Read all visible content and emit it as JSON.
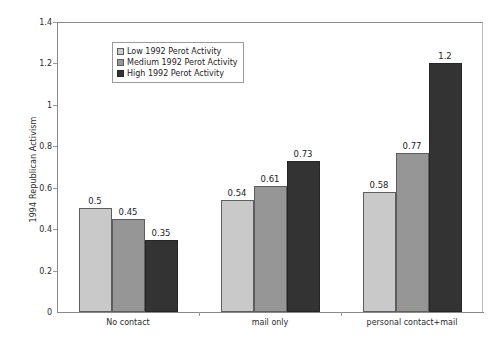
{
  "chart_data": {
    "type": "bar",
    "title": "",
    "xlabel": "",
    "ylabel": "1994 Republican Activism",
    "ylim": [
      0,
      1.4
    ],
    "ytick_step": 0.2,
    "yticks": [
      "1.4",
      "1.2",
      "1",
      "0.8",
      "0.6",
      "0.4",
      "0.2",
      "0"
    ],
    "ytick_values": [
      1.4,
      1.2,
      1.0,
      0.8,
      0.6,
      0.4,
      0.2,
      0
    ],
    "grid": false,
    "legend_position": "upper-left-inside",
    "categories": [
      "No contact",
      "mail only",
      "personal contact+mail"
    ],
    "series": [
      {
        "name": "Low 1992 Perot Activity",
        "color": "#c9c9c9",
        "values": [
          0.5,
          0.54,
          0.58
        ],
        "labels": [
          "0.5",
          "0.54",
          "0.58"
        ]
      },
      {
        "name": "Medium 1992 Perot Activity",
        "color": "#969696",
        "values": [
          0.45,
          0.61,
          0.77
        ],
        "labels": [
          "0.45",
          "0.61",
          "0.77"
        ]
      },
      {
        "name": "High 1992 Perot Activity",
        "color": "#333333",
        "values": [
          0.35,
          0.73,
          1.2
        ],
        "labels": [
          "0.35",
          "0.73",
          "1.2"
        ]
      }
    ]
  }
}
